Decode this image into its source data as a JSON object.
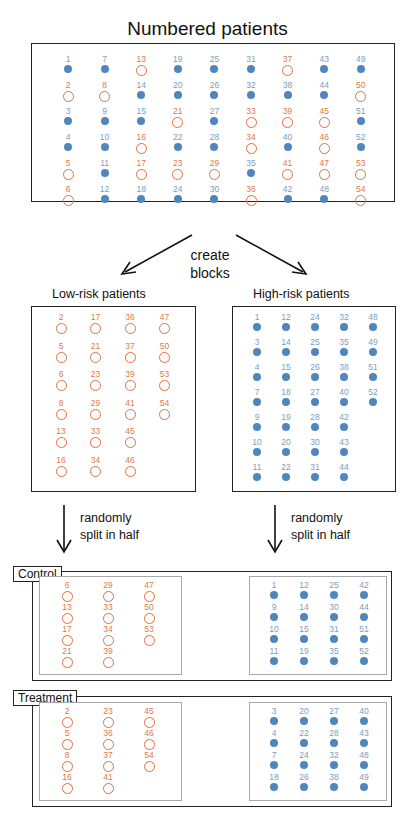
{
  "title": "Numbered patients",
  "colors": {
    "low_risk": "#e0713f",
    "high_risk": "#4f86be"
  },
  "legend_meaning": {
    "open_orange_circle": "low-risk",
    "filled_blue_dot": "high-risk"
  },
  "all_patients": {
    "columns": [
      [
        {
          "n": 1,
          "r": "high"
        },
        {
          "n": 2,
          "r": "low"
        },
        {
          "n": 3,
          "r": "high"
        },
        {
          "n": 4,
          "r": "high"
        },
        {
          "n": 5,
          "r": "low"
        },
        {
          "n": 6,
          "r": "low"
        }
      ],
      [
        {
          "n": 7,
          "r": "high"
        },
        {
          "n": 8,
          "r": "low"
        },
        {
          "n": 9,
          "r": "high"
        },
        {
          "n": 10,
          "r": "high"
        },
        {
          "n": 11,
          "r": "high"
        },
        {
          "n": 12,
          "r": "high"
        }
      ],
      [
        {
          "n": 13,
          "r": "low"
        },
        {
          "n": 14,
          "r": "high"
        },
        {
          "n": 15,
          "r": "high"
        },
        {
          "n": 16,
          "r": "low"
        },
        {
          "n": 17,
          "r": "low"
        },
        {
          "n": 18,
          "r": "high"
        }
      ],
      [
        {
          "n": 19,
          "r": "high"
        },
        {
          "n": 20,
          "r": "high"
        },
        {
          "n": 21,
          "r": "low"
        },
        {
          "n": 22,
          "r": "high"
        },
        {
          "n": 23,
          "r": "low"
        },
        {
          "n": 24,
          "r": "high"
        }
      ],
      [
        {
          "n": 25,
          "r": "high"
        },
        {
          "n": 26,
          "r": "high"
        },
        {
          "n": 27,
          "r": "high"
        },
        {
          "n": 28,
          "r": "high"
        },
        {
          "n": 29,
          "r": "low"
        },
        {
          "n": 30,
          "r": "high"
        }
      ],
      [
        {
          "n": 31,
          "r": "high"
        },
        {
          "n": 32,
          "r": "high"
        },
        {
          "n": 33,
          "r": "low"
        },
        {
          "n": 34,
          "r": "low"
        },
        {
          "n": 35,
          "r": "high"
        },
        {
          "n": 36,
          "r": "low"
        }
      ],
      [
        {
          "n": 37,
          "r": "low"
        },
        {
          "n": 38,
          "r": "high"
        },
        {
          "n": 39,
          "r": "low"
        },
        {
          "n": 40,
          "r": "high"
        },
        {
          "n": 41,
          "r": "low"
        },
        {
          "n": 42,
          "r": "high"
        }
      ],
      [
        {
          "n": 43,
          "r": "high"
        },
        {
          "n": 44,
          "r": "high"
        },
        {
          "n": 45,
          "r": "low"
        },
        {
          "n": 46,
          "r": "low"
        },
        {
          "n": 47,
          "r": "low"
        },
        {
          "n": 48,
          "r": "high"
        }
      ],
      [
        {
          "n": 49,
          "r": "high"
        },
        {
          "n": 50,
          "r": "low"
        },
        {
          "n": 51,
          "r": "high"
        },
        {
          "n": 52,
          "r": "high"
        },
        {
          "n": 53,
          "r": "low"
        },
        {
          "n": 54,
          "r": "low"
        }
      ]
    ]
  },
  "create_blocks_label": [
    "create",
    "blocks"
  ],
  "low_risk": {
    "label": "Low-risk patients",
    "columns": [
      [
        2,
        5,
        6,
        8,
        13,
        16
      ],
      [
        17,
        21,
        23,
        29,
        33,
        34
      ],
      [
        36,
        37,
        39,
        41,
        45,
        46
      ],
      [
        47,
        50,
        53,
        54
      ]
    ]
  },
  "high_risk": {
    "label": "High-risk patients",
    "columns": [
      [
        1,
        3,
        4,
        7,
        9,
        10,
        11
      ],
      [
        12,
        14,
        15,
        18,
        19,
        20,
        22
      ],
      [
        24,
        25,
        26,
        27,
        28,
        30,
        31
      ],
      [
        32,
        35,
        38,
        40,
        42,
        43,
        44
      ],
      [
        48,
        49,
        51,
        52
      ]
    ]
  },
  "split_label": [
    "randomly",
    "split in half"
  ],
  "control": {
    "label": "Control",
    "low_columns": [
      [
        6,
        13,
        17,
        21
      ],
      [
        29,
        33,
        34,
        39
      ],
      [
        47,
        50,
        53
      ]
    ],
    "high_columns": [
      [
        1,
        9,
        10,
        11
      ],
      [
        12,
        14,
        15,
        19
      ],
      [
        25,
        30,
        31,
        35
      ],
      [
        42,
        44,
        51,
        52
      ]
    ]
  },
  "treatment": {
    "label": "Treatment",
    "low_columns": [
      [
        2,
        5,
        8,
        16
      ],
      [
        23,
        36,
        37,
        41
      ],
      [
        45,
        46,
        54
      ]
    ],
    "high_columns": [
      [
        3,
        4,
        7,
        18
      ],
      [
        20,
        22,
        24,
        26
      ],
      [
        27,
        28,
        32,
        38
      ],
      [
        40,
        43,
        48,
        49
      ]
    ]
  }
}
